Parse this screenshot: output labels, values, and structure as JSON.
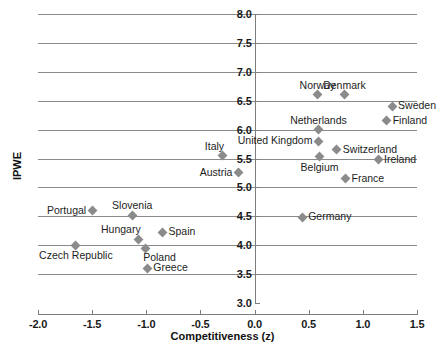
{
  "chart_data": {
    "type": "scatter",
    "title": "",
    "xlabel": "Competitiveness (z)",
    "ylabel": "IPWE",
    "xlim": [
      -2.0,
      1.5
    ],
    "ylim": [
      3.0,
      8.0
    ],
    "xticks": [
      "-2.0",
      "-1.5",
      "-1.0",
      "-0.5",
      "0.0",
      "0.5",
      "1.0",
      "1.5"
    ],
    "xtick_values": [
      -2.0,
      -1.5,
      -1.0,
      -0.5,
      0.0,
      0.5,
      1.0,
      1.5
    ],
    "yticks": [
      "3.0",
      "3.5",
      "4.0",
      "4.5",
      "5.0",
      "5.5",
      "6.0",
      "6.5",
      "7.0",
      "7.5",
      "8.0"
    ],
    "ytick_values": [
      3.0,
      3.5,
      4.0,
      4.5,
      5.0,
      5.5,
      6.0,
      6.5,
      7.0,
      7.5,
      8.0
    ],
    "grid": "horizontal",
    "legend": "none",
    "marker_color": "#8b8b8b",
    "marker_shape": "diamond",
    "points": [
      {
        "label": "Norway",
        "x": 0.58,
        "y": 6.6,
        "lab": "lab-above"
      },
      {
        "label": "Denmark",
        "x": 0.83,
        "y": 6.6,
        "lab": "lab-above"
      },
      {
        "label": "Sweden",
        "x": 1.27,
        "y": 6.4,
        "lab": "lab-right"
      },
      {
        "label": "Finland",
        "x": 1.22,
        "y": 6.15,
        "lab": "lab-right"
      },
      {
        "label": "Netherlands",
        "x": 0.59,
        "y": 6.0,
        "lab": "lab-above"
      },
      {
        "label": "United Kingdom",
        "x": 0.59,
        "y": 5.8,
        "lab": "lab-left"
      },
      {
        "label": "Switzerland",
        "x": 0.76,
        "y": 5.65,
        "lab": "lab-right"
      },
      {
        "label": "Belgium",
        "x": 0.6,
        "y": 5.53,
        "lab": "lab-below"
      },
      {
        "label": "Ireland",
        "x": 1.14,
        "y": 5.48,
        "lab": "lab-right"
      },
      {
        "label": "France",
        "x": 0.84,
        "y": 5.15,
        "lab": "lab-right"
      },
      {
        "label": "Italy",
        "x": -0.3,
        "y": 5.55,
        "lab": "lab-aboveleft"
      },
      {
        "label": "Austria",
        "x": -0.15,
        "y": 5.25,
        "lab": "lab-left"
      },
      {
        "label": "Germany",
        "x": 0.44,
        "y": 4.48,
        "lab": "lab-right"
      },
      {
        "label": "Portugal",
        "x": -1.5,
        "y": 4.6,
        "lab": "lab-left"
      },
      {
        "label": "Slovenia",
        "x": -1.13,
        "y": 4.52,
        "lab": "lab-above"
      },
      {
        "label": "Spain",
        "x": -0.85,
        "y": 4.22,
        "lab": "lab-right"
      },
      {
        "label": "Hungary",
        "x": -1.07,
        "y": 4.1,
        "lab": "lab-aboveleft"
      },
      {
        "label": "Czech Republic",
        "x": -1.65,
        "y": 4.0,
        "lab": "lab-below"
      },
      {
        "label": "Poland",
        "x": -1.01,
        "y": 3.95,
        "lab": "lab-belowright"
      },
      {
        "label": "Greece",
        "x": -0.99,
        "y": 3.6,
        "lab": "lab-right"
      }
    ]
  }
}
